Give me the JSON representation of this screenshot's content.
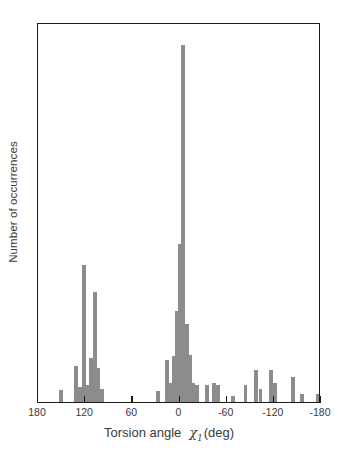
{
  "chart_data": {
    "type": "bar",
    "title": "",
    "xlabel": "Torsion angle χ₁ (deg)",
    "ylabel": "Number of occurrences",
    "xlabel_parts": {
      "prefix": "Torsion angle",
      "symbol": "χ",
      "subscript": "1",
      "units": "(deg)"
    },
    "xlim": [
      180,
      -180
    ],
    "ylim": [
      0,
      100
    ],
    "xticks": [
      180,
      120,
      60,
      0,
      -60,
      -120,
      -180
    ],
    "xticklabels": [
      "180",
      "120",
      "60",
      "0",
      "-60",
      "-120",
      "-180"
    ],
    "yticks": [],
    "yticklabels": [],
    "grid": false,
    "legend": null,
    "bar_color": "#8c8c8c",
    "axis_color": "#1a1a1a",
    "background": "#ffffff",
    "bin_width_deg": 5,
    "note": "Histogram of side-chain chi-1 torsion angles; x axis runs from +180 (left) to -180 (right).",
    "bars": [
      {
        "x": 151,
        "value": 3.2
      },
      {
        "x": 132,
        "value": 9.5
      },
      {
        "x": 127,
        "value": 4.0
      },
      {
        "x": 122,
        "value": 36.0
      },
      {
        "x": 117,
        "value": 4.5
      },
      {
        "x": 112,
        "value": 11.5
      },
      {
        "x": 108,
        "value": 29.0
      },
      {
        "x": 103,
        "value": 9.0
      },
      {
        "x": 98,
        "value": 3.5
      },
      {
        "x": 27,
        "value": 3.0
      },
      {
        "x": 16,
        "value": 11.0
      },
      {
        "x": 11,
        "value": 5.0
      },
      {
        "x": 7,
        "value": 12.0
      },
      {
        "x": 3,
        "value": 24.0
      },
      {
        "x": -1,
        "value": 41.5
      },
      {
        "x": -5,
        "value": 94.0
      },
      {
        "x": -9,
        "value": 20.5
      },
      {
        "x": -13,
        "value": 12.5
      },
      {
        "x": -17,
        "value": 5.0
      },
      {
        "x": -22,
        "value": 4.5
      },
      {
        "x": -35,
        "value": 4.5
      },
      {
        "x": -44,
        "value": 5.0
      },
      {
        "x": -49,
        "value": 4.5
      },
      {
        "x": -68,
        "value": 1.5
      },
      {
        "x": -84,
        "value": 4.5
      },
      {
        "x": -97,
        "value": 8.5
      },
      {
        "x": -103,
        "value": 3.5
      },
      {
        "x": -116,
        "value": 8.5
      },
      {
        "x": -122,
        "value": 5.0
      },
      {
        "x": -144,
        "value": 6.5
      },
      {
        "x": -156,
        "value": 2.0
      },
      {
        "x": -176,
        "value": 2.0
      }
    ]
  },
  "axis": {
    "x_title_prefix": "Torsion angle",
    "x_title_symbol": "χ",
    "x_title_subscript": "1",
    "x_title_units": "(deg)",
    "y_title": "Number of occurrences"
  }
}
